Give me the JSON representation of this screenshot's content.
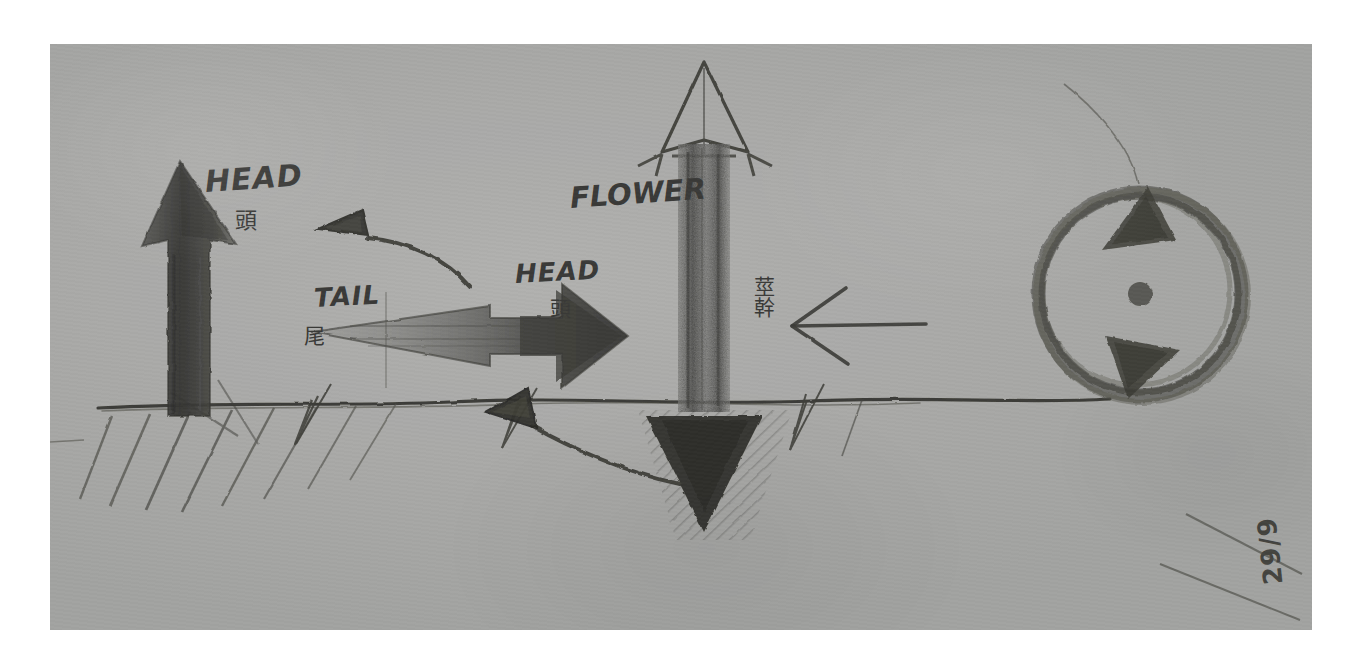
{
  "document": {
    "kind": "pencil-sketch-photograph",
    "medium": "graphite on grey paper",
    "date_stamp": "29/9"
  },
  "labels": {
    "head_left_latin": "HEAD",
    "head_left_cjk": "頭",
    "tail_latin": "TAIL",
    "tail_cjk": "尾",
    "head_mid_latin": "HEAD",
    "head_mid_cjk": "頭",
    "flower_latin": "FLOWER",
    "stem_cjk": "莖幹"
  },
  "figures": [
    {
      "id": "upward-head-arrow",
      "name": "solid upward arrow rooted in ground",
      "direction": "up",
      "fill": "solid-dark",
      "labels": [
        "HEAD",
        "頭"
      ]
    },
    {
      "id": "curved-tail-arrow",
      "name": "curved arrow with solid head pointing up-left",
      "direction": "up-left",
      "fill": "solid-dark",
      "labels": [
        "TAIL",
        "尾"
      ]
    },
    {
      "id": "horizontal-gradient-arrow",
      "name": "horizontal arrow, hollow tail to solid head",
      "direction": "right",
      "fill": "gradient-hollow-to-solid",
      "labels": [
        "TAIL",
        "尾",
        "HEAD",
        "頭"
      ]
    },
    {
      "id": "flower-stem-arrow",
      "name": "vertical double arrow, hollow head up and solid head down",
      "direction": "up-and-down",
      "fill": "hollow-top-solid-bottom",
      "labels": [
        "FLOWER",
        "莖幹"
      ]
    },
    {
      "id": "left-line-arrow",
      "name": "thin left pointing line arrow",
      "direction": "left",
      "fill": "line"
    },
    {
      "id": "curved-underground-arrow",
      "name": "curved arrow below ground pointing up-left",
      "direction": "up-left",
      "fill": "solid-dark"
    },
    {
      "id": "rotation-circle",
      "name": "clockwise rotation circle with two arrowheads and centre dot",
      "direction": "clockwise",
      "fill": "sketchy-ring"
    }
  ],
  "scene": {
    "ground_line": "horizontal ground line with diagonal hatching below on the left",
    "grass_tufts": 3,
    "buried_shading": "dense hatching around the downward arrowhead"
  },
  "colors": {
    "paper": "#a9a9a7",
    "graphite": "#3a3a38",
    "graphite_light": "#6f6f6c",
    "page_margin": "#ffffff"
  }
}
